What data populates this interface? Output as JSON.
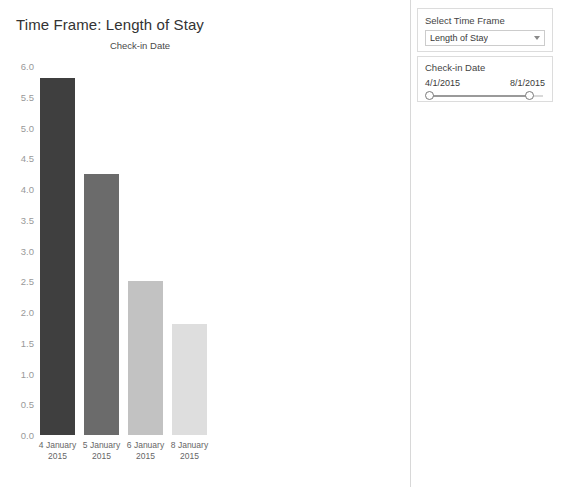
{
  "page_title": "Time Frame: Length of Stay",
  "chart_data": {
    "type": "bar",
    "title": "Time Frame: Length of Stay",
    "subtitle": "Check-in Date",
    "categories": [
      "4 January 2015",
      "5 January 2015",
      "6 January 2015",
      "8 January 2015"
    ],
    "category_lines": [
      [
        "4 January",
        "2015"
      ],
      [
        "5 January",
        "2015"
      ],
      [
        "6 January",
        "2015"
      ],
      [
        "8 January",
        "2015"
      ]
    ],
    "values": [
      5.8,
      4.25,
      2.5,
      1.8
    ],
    "colors": [
      "#3f3f3f",
      "#6b6b6b",
      "#c2c2c2",
      "#dedede"
    ],
    "xlabel": "",
    "ylabel": "",
    "ylim": [
      0.0,
      6.0
    ],
    "ytick_labels": [
      "6.0",
      "5.5",
      "5.0",
      "4.5",
      "4.0",
      "3.5",
      "3.0",
      "2.5",
      "2.0",
      "1.5",
      "1.0",
      "0.5",
      "0.0"
    ],
    "ytick_values": [
      6.0,
      5.5,
      5.0,
      4.5,
      4.0,
      3.5,
      3.0,
      2.5,
      2.0,
      1.5,
      1.0,
      0.5,
      0.0
    ],
    "grid": false,
    "legend": false
  },
  "controls": {
    "timeframe": {
      "label": "Select Time Frame",
      "selected": "Length of Stay",
      "options": [
        "Length of Stay"
      ]
    },
    "checkin": {
      "label": "Check-in Date",
      "min_value": "4/1/2015",
      "max_value": "8/1/2015"
    }
  }
}
